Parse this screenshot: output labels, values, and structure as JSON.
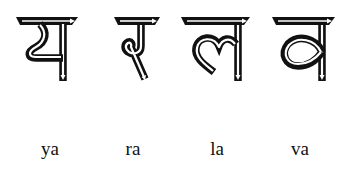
{
  "letters": [
    {
      "glyph": "य",
      "label": "ya",
      "x": 50
    },
    {
      "glyph": "र",
      "label": "ra",
      "x": 133
    },
    {
      "glyph": "ल",
      "label": "la",
      "x": 217
    },
    {
      "glyph": "व",
      "label": "va",
      "x": 300
    }
  ],
  "colors": {
    "ink": "#111111",
    "background": "#ffffff"
  }
}
